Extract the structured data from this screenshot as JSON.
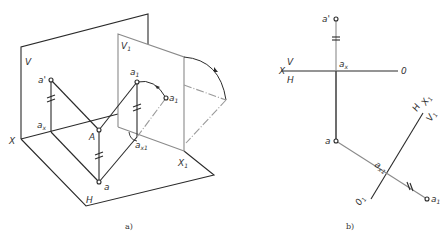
{
  "figure_a": {
    "caption": "a)",
    "labels": {
      "V": "V",
      "V1": "V",
      "V1_sub": "1",
      "X": "X",
      "X1": "X",
      "X1_sub": "1",
      "H": "H",
      "A": "A",
      "a_prime": "a'",
      "a1_prime": "a",
      "a1_prime_sup": "'",
      "a1_prime_sub": "1",
      "a1_prime_rot": "a",
      "a1_prime_rot_sub": "1",
      "a_x": "a",
      "a_x_sub": "x",
      "a_x1": "a",
      "a_x1_sub": "x1",
      "a": "a"
    }
  },
  "figure_b": {
    "caption": "b)",
    "labels": {
      "X": "X",
      "V": "V",
      "H": "H",
      "O": "0",
      "a_prime": "a'",
      "a_x": "a",
      "a_x_sub": "x",
      "a": "a",
      "a_x1": "a",
      "a_x1_sub": "x1",
      "H2": "H",
      "V1": "V",
      "V1_sub": "1",
      "X1": "X",
      "X1_sub": "1",
      "O1": "0",
      "O1_sub": "1",
      "a1_prime": "a",
      "a1_prime_sub": "1"
    }
  },
  "colors": {
    "line": "#2a2a2a",
    "light": "#8a8a8a",
    "bg": "#ffffff"
  }
}
